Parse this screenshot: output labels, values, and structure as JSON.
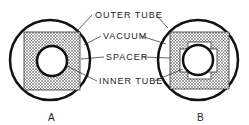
{
  "diagram": {
    "labels": {
      "outer_tube": "OUTER TUBE",
      "vacuum": "VACUUM",
      "spacer": "SPACER",
      "inner_tube": "INNER TUBE"
    },
    "captions": {
      "a": "A",
      "b": "B"
    },
    "colors": {
      "line": "#111111",
      "hatch": "#555555",
      "background": "#ffffff"
    }
  }
}
